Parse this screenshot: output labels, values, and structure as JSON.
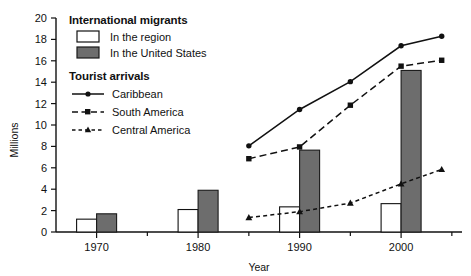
{
  "chart_data": {
    "type": "bar",
    "title": "",
    "xlabel": "Year",
    "ylabel": "Millions",
    "ylim": [
      0,
      20
    ],
    "xlim": [
      1966,
      2006
    ],
    "ytick_labels": [
      "0",
      "2",
      "4",
      "6",
      "8",
      "10",
      "12",
      "14",
      "16",
      "18",
      "20"
    ],
    "ytick_values": [
      0,
      2,
      4,
      6,
      8,
      10,
      12,
      14,
      16,
      18,
      20
    ],
    "xtick_labels": [
      "1970",
      "1980",
      "1990",
      "2000"
    ],
    "xtick_values": [
      1970,
      1980,
      1990,
      2000
    ],
    "xtick_minor_values": [
      1975,
      1985,
      1995,
      2005
    ],
    "grid": false,
    "legend_position": "upper-left inside plot",
    "legend_groups": [
      {
        "title": "International migrants",
        "entries": [
          {
            "label": "In the region",
            "marker": "open-square-swatch",
            "color": "#ffffff"
          },
          {
            "label": "In the United States",
            "marker": "filled-square-swatch",
            "color": "#6d6d6d"
          }
        ]
      },
      {
        "title": "Tourist arrivals",
        "entries": [
          {
            "label": "Caribbean",
            "marker": "circle",
            "line": "solid",
            "color": "#111111"
          },
          {
            "label": "South America",
            "marker": "square",
            "line": "dashed",
            "color": "#111111"
          },
          {
            "label": "Central America",
            "marker": "triangle",
            "line": "dotted-dashed",
            "color": "#111111"
          }
        ]
      }
    ],
    "bar_categories": [
      1970,
      1980,
      1990,
      2000
    ],
    "bar_series": [
      {
        "name": "In the region",
        "values": [
          1.2,
          2.1,
          2.35,
          2.65
        ]
      },
      {
        "name": "In the United States",
        "values": [
          1.7,
          3.9,
          7.65,
          15.1
        ]
      }
    ],
    "line_x": [
      1985,
      1990,
      1995,
      2000,
      2004
    ],
    "series": [
      {
        "name": "Caribbean",
        "values": [
          8.05,
          11.45,
          14.05,
          17.4,
          18.3
        ]
      },
      {
        "name": "South America",
        "values": [
          6.85,
          7.95,
          11.85,
          15.5,
          16.05
        ]
      },
      {
        "name": "Central America",
        "values": [
          1.35,
          1.9,
          2.7,
          4.5,
          5.85
        ]
      }
    ]
  },
  "axes": {
    "y_title": "Millions",
    "x_title": "Year",
    "y_ticks": [
      "20",
      "18",
      "16",
      "14",
      "12",
      "10",
      "8",
      "6",
      "4",
      "2",
      "0"
    ],
    "x_ticks": [
      "1970",
      "1980",
      "1990",
      "2000"
    ]
  },
  "legend": {
    "migrants_title": "International migrants",
    "migrants_region": "In the region",
    "migrants_us": "In the United States",
    "tourist_title": "Tourist arrivals",
    "tourist_caribbean": "Caribbean",
    "tourist_south_america": "South America",
    "tourist_central_america": "Central America"
  },
  "colors": {
    "bar_us_fill": "#6d6d6d",
    "bar_region_fill": "#ffffff",
    "ink": "#111111"
  }
}
